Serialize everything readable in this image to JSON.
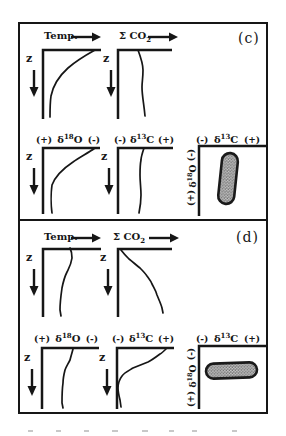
{
  "figure": {
    "panel_c_label": "(c)",
    "panel_d_label": "(d)",
    "ink_color": "#161616",
    "background_color": "#ffffff"
  },
  "panels": [
    {
      "label": "(c)",
      "temp": {
        "title": "Temp.",
        "z": "z",
        "curve": "M55,4 C46,9 36,15 28,22 C18,31 13,40 11,50 C10,57 10,64 10,71"
      },
      "co2": {
        "title_main": "Σ CO",
        "title_sub": "2",
        "z": "z",
        "curve": "M24,4 C27,12 29,18 29,24 C29,32 28,36 28,41 C28,50 30,58 31,70"
      },
      "d18o": {
        "left": "(+)",
        "sym": "δ",
        "sup": "18",
        "el": "O",
        "right": "(-)",
        "z": "z",
        "curve": "M55,4 C48,9 40,13 33,18 C24,24 15,33 12,41 C11,48 11,62 12,69"
      },
      "d13c": {
        "left": "(-)",
        "sym": "δ",
        "sup": "13",
        "el": "C",
        "right": "(+)",
        "z": "z",
        "curve": "M29,4 C27,10 26,13 26,16 C25,21 25,26 25,31 C25,38 26,44 26,51 C26,58 25,64 24,69"
      },
      "cross": {
        "x_left": "(-)",
        "x_sym": "δ",
        "x_sup": "13",
        "x_el": "C",
        "x_right": "(+)",
        "y_top": "(-)",
        "y_sym": "δ",
        "y_sup": "18",
        "y_el": "O",
        "y_bottom": "(+)",
        "blob_orientation": "vertical"
      }
    },
    {
      "label": "(d)",
      "temp": {
        "title": "Temp.",
        "z": "z",
        "curve": "M30,3 C32,7 32,10 32,13 C31,20 29,23 27,27 C24,33 23,38 22,43 C21,50 20,58 20,65 L21,71"
      },
      "co2": {
        "title_main": "Σ CO",
        "title_sub": "2",
        "z": "z",
        "curve": "M7,5 C10,9 12,11 15,14 C19,17 22,20 26,23 C29,26 31,28 33,31 C36,35 37,36 38,39 C40,43 42,46 43,50 C45,55 47,59 48,63 L49,68"
      },
      "d18o": {
        "left": "(+)",
        "sym": "δ",
        "sup": "18",
        "el": "O",
        "right": "(-)",
        "z": "z",
        "curve": "M35,5 C34,9 33,12 32,16 C30,20 28,23 27,26 C26,30 25,35 25,39 C24,46 24,53 24,59 L25,64"
      },
      "d13c": {
        "left": "(-)",
        "sym": "δ",
        "sup": "13",
        "el": "C",
        "right": "(+)",
        "z": "z",
        "curve": "M53,5 C51,7 49,9 47,10 C43,13 39,16 35,18 C30,20 25,22 20,24 C15,27 11,29 9,32 C6,36 5,40 5,44 C5,48 6,52 7,56 L8,63"
      },
      "cross": {
        "x_left": "(-)",
        "x_sym": "δ",
        "x_sup": "13",
        "x_el": "C",
        "x_right": "(+)",
        "y_top": "(-)",
        "y_sym": "δ",
        "y_sup": "18",
        "y_el": "O",
        "y_bottom": "(+)",
        "blob_orientation": "horizontal"
      }
    }
  ]
}
